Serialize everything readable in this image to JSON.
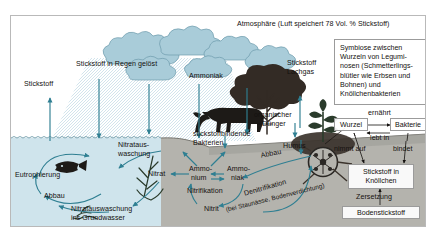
{
  "figure": {
    "title_text": "Atmosphäre (Luft speichert 78 Vol. % Stickstoff)",
    "domain": "biology-diagram",
    "language": "de"
  },
  "colors": {
    "water": "#cfe4ec",
    "soil": "#b4b3ad",
    "soil_dark": "#8e8d88",
    "arrow": "#2f7f92",
    "ink": "#14110f",
    "cloud": "#a9ccd9",
    "frame": "#b9b9b9",
    "sky": "#ffffff",
    "plant_green": "#2e4a33"
  },
  "labels": {
    "atmosphere": "Atmosphäre (Luft speichert 78 Vol. % Stickstoff)",
    "stickstoff_left": "Stickstoff",
    "stickstoff_in_regen": "Stickstoff in Regen gelöst",
    "ammoniak_cloud": "Ammoniak",
    "stickstoff_lachgas_1": "Stickstoff",
    "stickstoff_lachgas_2": "Lachgas",
    "organischer_duenger_1": "organischer",
    "organischer_duenger_2": "Dünger",
    "stickstoffbindende_1": "stickstoffbindende",
    "stickstoffbindende_2": "Bakterien",
    "humus": "Humus",
    "nitrataus_1": "Nitrataus-",
    "nitrataus_2": "waschung",
    "nitrat": "Nitrat",
    "ammonium_1": "Ammo-",
    "ammonium_2": "nium",
    "ammoniak_soil_1": "Ammo-",
    "ammoniak_soil_2": "niak",
    "nitrifikation": "Nitrifikation",
    "nitrit": "Nitrit",
    "nitrataus_gw_1": "Nitratauswaschung",
    "nitrataus_gw_2": "ins Grundwasser",
    "eutrophierung": "Eutrophierung",
    "abbau_water": "Abbau",
    "abbau_soil": "Abbau",
    "denitrifikation": "Denitrifikation",
    "denitrifikation_sub": "(bei Staunässe, Bodenverdichtung)"
  },
  "symbiose_box": {
    "lines": [
      "Symbiose zwischen",
      "Wurzeln von Legumi-",
      "nosen (Schmetterlings-",
      "blütler wie Erbsen und",
      "Bohnen) und",
      "Knöllchenbakterien"
    ]
  },
  "symbiose_cycle": {
    "node_wurzel": "Wurzel",
    "node_bakterie": "Bakterie",
    "node_stickstoff_knoellchen_1": "Stickstoff in",
    "node_stickstoff_knoellchen_2": "Knöllchen",
    "node_bodenstickstoff": "Bodenstickstoff",
    "edge_ernaehrt": "ernährt",
    "edge_lebt_in": "lebt in",
    "edge_nimmt_auf": "nimmt auf",
    "edge_bindet": "bindet",
    "edge_zersetzung": "Zersetzung"
  },
  "scene_icons": {
    "clouds": "cloud-icon",
    "tree": "tree-icon",
    "cow": "cow-silhouette-icon",
    "fish": "fish-icon",
    "algae": "algae-icon",
    "legume_plant": "legume-plant-icon",
    "root_nodule_zoom": "root-nodule-magnifier-icon",
    "rain": "rain-arrow-icon",
    "water_surface": "water-surface-icon"
  }
}
